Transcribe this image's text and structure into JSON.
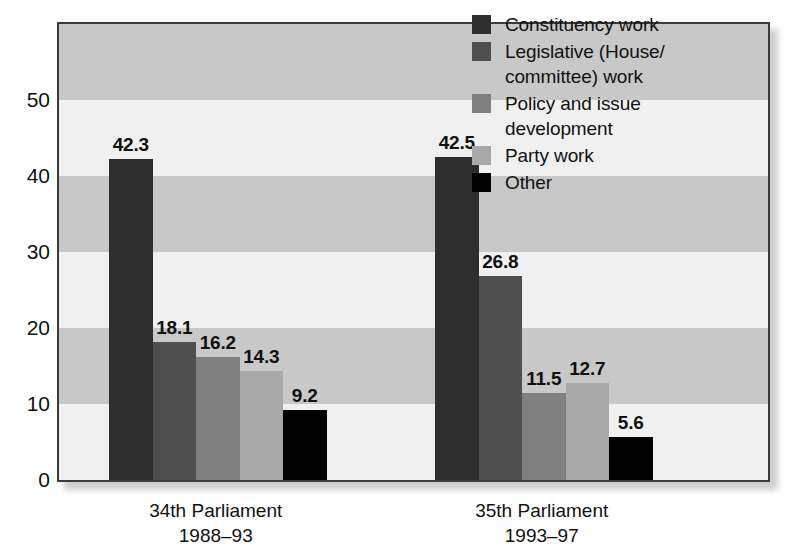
{
  "chart_data": {
    "type": "bar",
    "title": "",
    "subtitle": "",
    "xlabel": "",
    "ylabel": "",
    "ylim": [
      0,
      60
    ],
    "yticks": [
      0,
      10,
      20,
      30,
      40,
      50
    ],
    "grid": "horizontal-alternating-bands",
    "legend_position": "top-right",
    "categories": [
      "34th Parliament\n1988–93",
      "35th Parliament\n1993–97"
    ],
    "category_lines": [
      [
        "34th Parliament",
        "1988–93"
      ],
      [
        "35th Parliament",
        "1993–97"
      ]
    ],
    "series": [
      {
        "name": "Constituency work",
        "color": "#2e2e2e",
        "values": [
          42.3,
          42.5
        ]
      },
      {
        "name": "Legislative (House/committee) work",
        "color": "#4f4f4f",
        "values": [
          18.1,
          26.8
        ]
      },
      {
        "name": "Policy and issue development",
        "color": "#808080",
        "values": [
          16.2,
          11.5
        ]
      },
      {
        "name": "Party work",
        "color": "#a8a8a8",
        "values": [
          14.3,
          12.7
        ]
      },
      {
        "name": "Other",
        "color": "#000000",
        "values": [
          9.2,
          5.6
        ]
      }
    ],
    "legend_entries": [
      {
        "label_lines": [
          "Constituency work"
        ],
        "color": "#2e2e2e"
      },
      {
        "label_lines": [
          "Legislative (House/",
          "committee) work"
        ],
        "color": "#4f4f4f"
      },
      {
        "label_lines": [
          "Policy and issue",
          "development"
        ],
        "color": "#808080"
      },
      {
        "label_lines": [
          "Party work"
        ],
        "color": "#a8a8a8"
      },
      {
        "label_lines": [
          "Other"
        ],
        "color": "#000000"
      }
    ],
    "value_labels": [
      [
        "42.3",
        "18.1",
        "16.2",
        "14.3",
        "9.2"
      ],
      [
        "42.5",
        "26.8",
        "11.5",
        "12.7",
        "5.6"
      ]
    ],
    "band_colors": {
      "dark": "#c8c8c8",
      "light": "#f0f0f0"
    },
    "frame_color": "#3b3b3b"
  }
}
